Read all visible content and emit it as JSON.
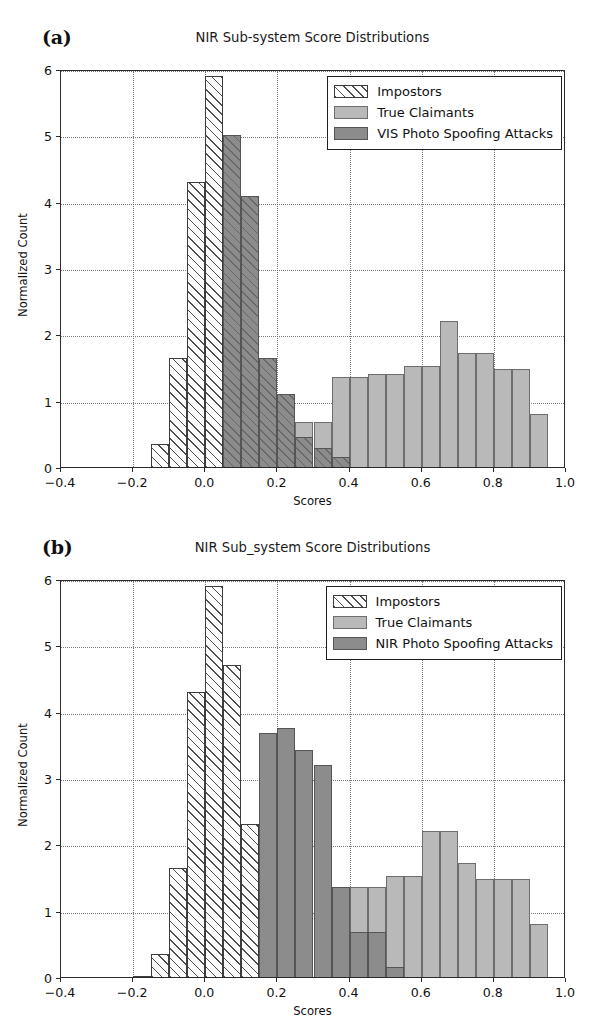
{
  "figure": {
    "width": 604,
    "height": 1020,
    "background": "#ffffff"
  },
  "colors": {
    "impostors_face": "#fcfcfc",
    "impostors_edge": "#3d3d3d",
    "true_claimants": "#b9b9b9",
    "spoof_attacks": "#8c8c8c",
    "axis": "#2b2b2b",
    "grid": "#7a7a7a",
    "text": "#111111"
  },
  "panels": [
    {
      "letter": "(a)",
      "title": "NIR Sub-system Score Distributions",
      "legend": {
        "position": "upper right",
        "entries": [
          {
            "label": "Impostors",
            "style": "hatched-white",
            "swatch": "impostors"
          },
          {
            "label": "True Claimants",
            "style": "light-gray",
            "swatch": "true"
          },
          {
            "label": "VIS Photo Spoofing Attacks",
            "style": "dark-gray",
            "swatch": "spoof"
          }
        ]
      }
    },
    {
      "letter": "(b)",
      "title": "NIR Sub_system Score Distributions",
      "legend": {
        "position": "upper right",
        "entries": [
          {
            "label": "Impostors",
            "style": "hatched-white",
            "swatch": "impostors"
          },
          {
            "label": "True Claimants",
            "style": "light-gray",
            "swatch": "true"
          },
          {
            "label": "NIR Photo Spoofing Attacks",
            "style": "dark-gray",
            "swatch": "spoof"
          }
        ]
      }
    }
  ],
  "axes": {
    "xlabel": "Scores",
    "ylabel": "Normalized Count",
    "xlim": [
      -0.4,
      1.0
    ],
    "ylim": [
      0,
      6
    ],
    "xticks": [
      -0.4,
      -0.2,
      0.0,
      0.2,
      0.4,
      0.6,
      0.8,
      1.0
    ],
    "xticklabels": [
      "-0.4",
      "-0.2",
      "0.0",
      "0.2",
      "0.4",
      "0.6",
      "0.8",
      "1.0"
    ],
    "yticks": [
      0,
      1,
      2,
      3,
      4,
      5,
      6
    ],
    "yticklabels": [
      "0",
      "1",
      "2",
      "3",
      "4",
      "5",
      "6"
    ],
    "grid": true,
    "grid_style": "dotted"
  },
  "chart_data": [
    {
      "type": "bar",
      "subtype": "histogram",
      "panel": "(a)",
      "title": "NIR Sub-system Score Distributions",
      "xlabel": "Scores",
      "ylabel": "Normalized Count",
      "xlim": [
        -0.4,
        1.0
      ],
      "ylim": [
        0,
        6
      ],
      "grid": true,
      "legend_position": "upper right",
      "bin_width": 0.05,
      "series": [
        {
          "name": "Impostors",
          "bin_starts": [
            -0.2,
            -0.15,
            -0.1,
            -0.05,
            0.0,
            0.05
          ],
          "values": [
            0.0,
            0.35,
            1.65,
            4.3,
            5.9,
            0.0
          ]
        },
        {
          "name": "True Claimants",
          "bin_starts": [
            0.25,
            0.3,
            0.35,
            0.4,
            0.45,
            0.5,
            0.55,
            0.6,
            0.65,
            0.7,
            0.75,
            0.8,
            0.85,
            0.9
          ],
          "values": [
            0.68,
            0.68,
            1.35,
            1.35,
            1.4,
            1.4,
            1.53,
            1.53,
            2.2,
            1.72,
            1.72,
            1.48,
            1.48,
            0.8
          ]
        },
        {
          "name": "VIS Photo Spoofing Attacks",
          "bin_starts": [
            -0.1,
            -0.05,
            0.0,
            0.05,
            0.1,
            0.15,
            0.2,
            0.25,
            0.3,
            0.35
          ],
          "values": [
            0.98,
            3.46,
            4.66,
            5.0,
            4.08,
            1.65,
            1.1,
            0.45,
            0.28,
            0.15
          ]
        }
      ]
    },
    {
      "type": "bar",
      "subtype": "histogram",
      "panel": "(b)",
      "title": "NIR Sub_system Score Distributions",
      "xlabel": "Scores",
      "ylabel": "Normalized Count",
      "xlim": [
        -0.4,
        1.0
      ],
      "ylim": [
        0,
        6
      ],
      "grid": true,
      "legend_position": "upper right",
      "bin_width": 0.05,
      "series": [
        {
          "name": "Impostors",
          "bin_starts": [
            -0.2,
            -0.15,
            -0.1,
            -0.05,
            0.0,
            0.05,
            0.1
          ],
          "values": [
            0.02,
            0.35,
            1.65,
            4.3,
            5.9,
            4.7,
            2.3
          ]
        },
        {
          "name": "True Claimants",
          "bin_starts": [
            0.4,
            0.45,
            0.5,
            0.55,
            0.6,
            0.65,
            0.7,
            0.75,
            0.8,
            0.85,
            0.9
          ],
          "values": [
            1.35,
            1.35,
            1.53,
            1.53,
            2.2,
            2.2,
            1.72,
            1.48,
            1.48,
            1.48,
            0.8
          ]
        },
        {
          "name": "NIR Photo Spoofing Attacks",
          "bin_starts": [
            0.0,
            0.05,
            0.1,
            0.15,
            0.2,
            0.25,
            0.3,
            0.35,
            0.4,
            0.45,
            0.5
          ],
          "values": [
            0.4,
            1.42,
            1.42,
            3.68,
            3.76,
            3.42,
            3.2,
            1.35,
            0.68,
            0.68,
            0.15
          ]
        }
      ]
    }
  ]
}
